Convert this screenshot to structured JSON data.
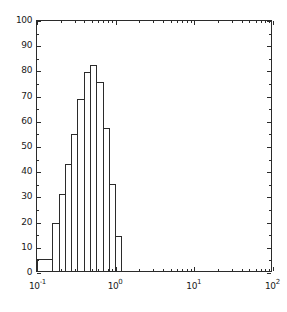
{
  "chart_data": {
    "type": "bar",
    "title": "",
    "subtitle": "",
    "xlabel": "",
    "ylabel": "",
    "xscale": "log",
    "yscale": "linear",
    "xlim": [
      -1,
      2
    ],
    "ylim": [
      0,
      100
    ],
    "grid": false,
    "legend": null,
    "annotations": [],
    "note": "Histogram outline (unfilled) on logarithmic x-axis; bin edges given as log10(x).",
    "bin_edges_log10": [
      -1.0,
      -0.8,
      -0.72,
      -0.64,
      -0.56,
      -0.48,
      -0.4,
      -0.32,
      -0.24,
      -0.16,
      -0.08,
      0.0,
      0.08
    ],
    "categories": [
      "10^-1.00 - 10^-0.80",
      "10^-0.80 - 10^-0.72",
      "10^-0.72 - 10^-0.64",
      "10^-0.64 - 10^-0.56",
      "10^-0.56 - 10^-0.48",
      "10^-0.48 - 10^-0.40",
      "10^-0.40 - 10^-0.32",
      "10^-0.32 - 10^-0.24",
      "10^-0.24 - 10^-0.16",
      "10^-0.16 - 10^-0.08",
      "10^-0.08 - 10^0.00",
      "10^0.00 - 10^0.08"
    ],
    "values": [
      5.5,
      19.5,
      31,
      43,
      55,
      69,
      79.5,
      82.5,
      75.5,
      57.5,
      35,
      14.5
    ],
    "x_ticks_major": [
      -1,
      0,
      1,
      2
    ],
    "x_tick_labels": [
      "10^-1",
      "10^0",
      "10^1",
      "10^2"
    ],
    "x_tick_mantissa": "10",
    "x_tick_exponents": [
      "-1",
      "0",
      "1",
      "2"
    ],
    "y_ticks_major": [
      0,
      10,
      20,
      30,
      40,
      50,
      60,
      70,
      80,
      90,
      100
    ],
    "y_tick_labels": [
      "0",
      "10",
      "20",
      "30",
      "40",
      "50",
      "60",
      "70",
      "80",
      "90",
      "100"
    ],
    "y_minor_step": 5,
    "colors": {
      "line": "#2b2b2b",
      "background": "#ffffff",
      "text": "#1a1a1a"
    }
  }
}
